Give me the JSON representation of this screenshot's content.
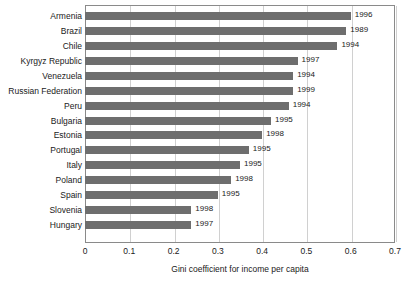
{
  "chart_data": {
    "type": "bar",
    "orientation": "horizontal",
    "title": "",
    "xlabel": "Gini coefficient for income per capita",
    "ylabel": "",
    "xlim": [
      0,
      0.7
    ],
    "xticks": [
      "0",
      "0.1",
      "0.2",
      "0.3",
      "0.4",
      "0.5",
      "0.6",
      "0.7"
    ],
    "xtick_values": [
      0,
      0.1,
      0.2,
      0.3,
      0.4,
      0.5,
      0.6,
      0.7
    ],
    "grid": "vertical",
    "legend": "none",
    "bar_color": "#6e6e6e",
    "categories": [
      "Armenia",
      "Brazil",
      "Chile",
      "Kyrgyz Republic",
      "Venezuela",
      "Russian Federation",
      "Peru",
      "Bulgaria",
      "Estonia",
      "Portugal",
      "Italy",
      "Poland",
      "Spain",
      "Slovenia",
      "Hungary"
    ],
    "values": [
      0.6,
      0.59,
      0.57,
      0.48,
      0.47,
      0.47,
      0.46,
      0.42,
      0.4,
      0.37,
      0.35,
      0.33,
      0.3,
      0.24,
      0.24
    ],
    "point_labels": [
      "1996",
      "1989",
      "1994",
      "1997",
      "1994",
      "1999",
      "1994",
      "1995",
      "1998",
      "1995",
      "1995",
      "1998",
      "1995",
      "1998",
      "1997"
    ],
    "bars": [
      {
        "category": "Armenia",
        "value": 0.6,
        "year": "1996"
      },
      {
        "category": "Brazil",
        "value": 0.59,
        "year": "1989"
      },
      {
        "category": "Chile",
        "value": 0.57,
        "year": "1994"
      },
      {
        "category": "Kyrgyz Republic",
        "value": 0.48,
        "year": "1997"
      },
      {
        "category": "Venezuela",
        "value": 0.47,
        "year": "1994"
      },
      {
        "category": "Russian Federation",
        "value": 0.47,
        "year": "1999"
      },
      {
        "category": "Peru",
        "value": 0.46,
        "year": "1994"
      },
      {
        "category": "Bulgaria",
        "value": 0.42,
        "year": "1995"
      },
      {
        "category": "Estonia",
        "value": 0.4,
        "year": "1998"
      },
      {
        "category": "Portugal",
        "value": 0.37,
        "year": "1995"
      },
      {
        "category": "Italy",
        "value": 0.35,
        "year": "1995"
      },
      {
        "category": "Poland",
        "value": 0.33,
        "year": "1998"
      },
      {
        "category": "Spain",
        "value": 0.3,
        "year": "1995"
      },
      {
        "category": "Slovenia",
        "value": 0.24,
        "year": "1998"
      },
      {
        "category": "Hungary",
        "value": 0.24,
        "year": "1997"
      }
    ]
  }
}
